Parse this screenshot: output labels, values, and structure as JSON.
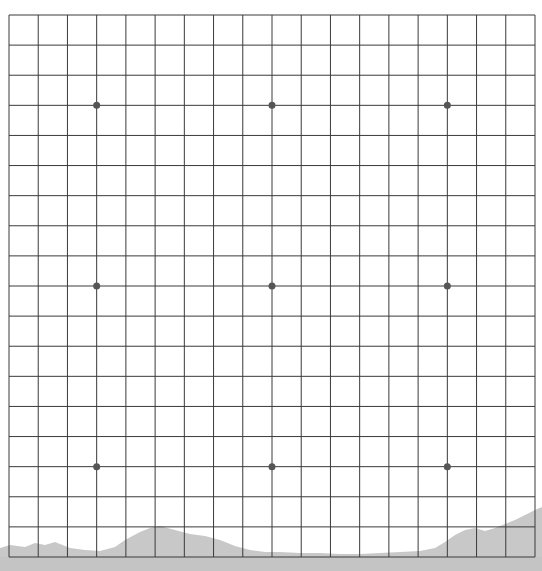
{
  "game": {
    "type": "go-board",
    "size": 19,
    "star_points": [
      [
        3,
        3
      ],
      [
        9,
        3
      ],
      [
        15,
        3
      ],
      [
        3,
        9
      ],
      [
        9,
        9
      ],
      [
        15,
        9
      ],
      [
        3,
        15
      ],
      [
        9,
        15
      ],
      [
        15,
        15
      ]
    ],
    "stones": []
  },
  "layout": {
    "x0": 9,
    "x1": 535,
    "y0": 15,
    "y1": 557
  },
  "colors": {
    "background": "#ffffff",
    "grid_line": "#3a3a3a",
    "star_point": "#555555",
    "mountain": "#c8c8c8"
  }
}
